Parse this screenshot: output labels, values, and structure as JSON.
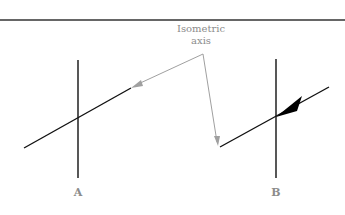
{
  "diagram": {
    "callout": {
      "line1": "Isometric",
      "line2": "axis"
    },
    "figures": [
      {
        "id": "A",
        "label": "A",
        "arrow": "open-grey-pointer-at-end"
      },
      {
        "id": "B",
        "label": "B",
        "arrow": "solid-black-arrowhead-at-intersection"
      }
    ],
    "colors": {
      "rule": "#333333",
      "line": "#111111",
      "leader": "#a0a0a0",
      "label": "#8c8c8c",
      "arrowhead": "#000000"
    }
  }
}
